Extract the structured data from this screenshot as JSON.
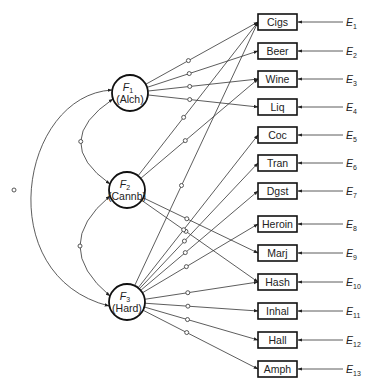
{
  "diagram": {
    "type": "confirmatory-factor-model",
    "factors": [
      {
        "id": "F1",
        "letter": "F",
        "sub": "1",
        "label": "(Alch)",
        "cx": 130,
        "cy": 93
      },
      {
        "id": "F2",
        "letter": "F",
        "sub": "2",
        "label": "(Cannb)",
        "cx": 127,
        "cy": 190
      },
      {
        "id": "F3",
        "letter": "F",
        "sub": "3",
        "label": "(Hard)",
        "cx": 127,
        "cy": 302
      }
    ],
    "indicators": [
      {
        "label": "Cigs",
        "error": "E",
        "error_sub": "1",
        "cy": 22
      },
      {
        "label": "Beer",
        "error": "E",
        "error_sub": "2",
        "cy": 51
      },
      {
        "label": "Wine",
        "error": "E",
        "error_sub": "3",
        "cy": 79
      },
      {
        "label": "Liq",
        "error": "E",
        "error_sub": "4",
        "cy": 107
      },
      {
        "label": "Coc",
        "error": "E",
        "error_sub": "5",
        "cy": 135
      },
      {
        "label": "Tran",
        "error": "E",
        "error_sub": "6",
        "cy": 163
      },
      {
        "label": "Dgst",
        "error": "E",
        "error_sub": "7",
        "cy": 191
      },
      {
        "label": "Heroin",
        "error": "E",
        "error_sub": "8",
        "cy": 224
      },
      {
        "label": "Marj",
        "error": "E",
        "error_sub": "9",
        "cy": 253
      },
      {
        "label": "Hash",
        "error": "E",
        "error_sub": "10",
        "cy": 282
      },
      {
        "label": "Inhal",
        "error": "E",
        "error_sub": "11",
        "cy": 311
      },
      {
        "label": "Hall",
        "error": "E",
        "error_sub": "12",
        "cy": 340
      },
      {
        "label": "Amph",
        "error": "E",
        "error_sub": "13",
        "cy": 369
      }
    ],
    "loadings": {
      "F1": [
        "Cigs",
        "Beer",
        "Wine",
        "Liq"
      ],
      "F2": [
        "Cigs",
        "Wine",
        "Marj",
        "Hash"
      ],
      "F3": [
        "Cigs",
        "Coc",
        "Tran",
        "Dgst",
        "Heroin",
        "Hash",
        "Inhal",
        "Hall",
        "Amph"
      ]
    },
    "covariances": [
      [
        "F1",
        "F2"
      ],
      [
        "F2",
        "F3"
      ],
      [
        "F1",
        "F3"
      ]
    ]
  }
}
